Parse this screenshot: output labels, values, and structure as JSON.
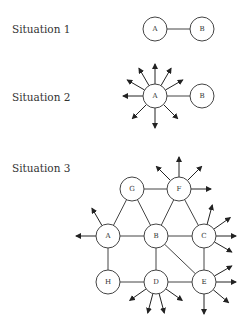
{
  "situations": [
    {
      "label": "Situation 1",
      "label_pos": [
        12,
        33
      ],
      "nodes": [
        {
          "id": "A",
          "x": 155,
          "y": 29
        },
        {
          "id": "B",
          "x": 202,
          "y": 29
        }
      ],
      "edges": [
        [
          "A",
          "B"
        ]
      ],
      "arrows": []
    },
    {
      "label": "Situation 2",
      "label_pos": [
        12,
        101
      ],
      "nodes": [
        {
          "id": "A",
          "x": 155,
          "y": 96
        },
        {
          "id": "B",
          "x": 202,
          "y": 96
        }
      ],
      "edges": [
        [
          "A",
          "B"
        ]
      ],
      "arrows": [
        {
          "from": "A",
          "angle": -90,
          "len": 30
        },
        {
          "from": "A",
          "angle": -120,
          "len": 30
        },
        {
          "from": "A",
          "angle": -60,
          "len": 30
        },
        {
          "from": "A",
          "angle": -150,
          "len": 30
        },
        {
          "from": "A",
          "angle": -30,
          "len": 30
        },
        {
          "from": "A",
          "angle": 180,
          "len": 30
        },
        {
          "from": "A",
          "angle": 135,
          "len": 30
        },
        {
          "from": "A",
          "angle": 90,
          "len": 30
        },
        {
          "from": "A",
          "angle": 45,
          "len": 30
        }
      ]
    },
    {
      "label": "Situation 3",
      "label_pos": [
        12,
        172
      ],
      "nodes": [
        {
          "id": "G",
          "x": 132,
          "y": 189
        },
        {
          "id": "F",
          "x": 179,
          "y": 189
        },
        {
          "id": "A",
          "x": 108,
          "y": 236
        },
        {
          "id": "B",
          "x": 156,
          "y": 236
        },
        {
          "id": "C",
          "x": 204,
          "y": 236
        },
        {
          "id": "H",
          "x": 108,
          "y": 282
        },
        {
          "id": "D",
          "x": 156,
          "y": 282
        },
        {
          "id": "E",
          "x": 204,
          "y": 282
        }
      ],
      "edges": [
        [
          "G",
          "F"
        ],
        [
          "G",
          "A"
        ],
        [
          "G",
          "B"
        ],
        [
          "F",
          "B"
        ],
        [
          "F",
          "C"
        ],
        [
          "A",
          "B"
        ],
        [
          "B",
          "C"
        ],
        [
          "A",
          "H"
        ],
        [
          "B",
          "D"
        ],
        [
          "B",
          "E"
        ],
        [
          "C",
          "E"
        ],
        [
          "H",
          "D"
        ],
        [
          "D",
          "E"
        ]
      ],
      "arrows": [
        {
          "from": "F",
          "angle": -90,
          "len": 30
        },
        {
          "from": "F",
          "angle": -135,
          "len": 30
        },
        {
          "from": "F",
          "angle": -45,
          "len": 30
        },
        {
          "from": "F",
          "angle": 0,
          "len": 30
        },
        {
          "from": "A",
          "angle": 180,
          "len": 30
        },
        {
          "from": "A",
          "angle": -120,
          "len": 30
        },
        {
          "from": "C",
          "angle": -75,
          "len": 30
        },
        {
          "from": "C",
          "angle": -35,
          "len": 30
        },
        {
          "from": "C",
          "angle": 0,
          "len": 30
        },
        {
          "from": "C",
          "angle": 30,
          "len": 30
        },
        {
          "from": "E",
          "angle": -30,
          "len": 30
        },
        {
          "from": "E",
          "angle": 0,
          "len": 30
        },
        {
          "from": "E",
          "angle": 40,
          "len": 30
        },
        {
          "from": "E",
          "angle": 90,
          "len": 30
        },
        {
          "from": "D",
          "angle": 145,
          "len": 30
        },
        {
          "from": "D",
          "angle": 105,
          "len": 30
        },
        {
          "from": "D",
          "angle": 75,
          "len": 30
        },
        {
          "from": "D",
          "angle": 35,
          "len": 30
        }
      ]
    }
  ],
  "node_radius": 12,
  "colors": {
    "stroke": "#444444",
    "text": "#333333",
    "background": "#ffffff"
  }
}
